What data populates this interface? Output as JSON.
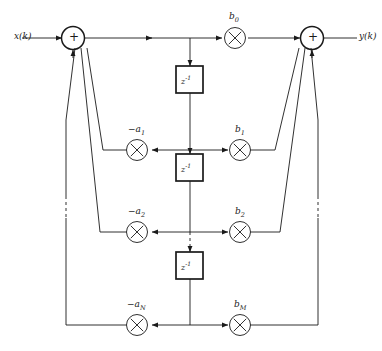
{
  "diagram": {
    "stroke_color": "#1a1a1a",
    "background_color": "#ffffff",
    "input_label": "x(k)",
    "output_label": "y(k)",
    "adder_symbol": "+",
    "multiplier_symbol": "✕",
    "delay_base": "z",
    "delay_exponent": "-1",
    "delay_blocks": [
      {
        "name": "delay-1",
        "label_base": "z",
        "label_exp": "-1"
      },
      {
        "name": "delay-2",
        "label_base": "z",
        "label_exp": "-1"
      },
      {
        "name": "delay-3",
        "label_base": "z",
        "label_exp": "-1"
      }
    ],
    "feedback_coefficients": [
      {
        "base": "−a",
        "sub": "1"
      },
      {
        "base": "−a",
        "sub": "2"
      },
      {
        "base": "−a",
        "sub": "N"
      }
    ],
    "feedforward_coefficients": [
      {
        "base": "b",
        "sub": "0"
      },
      {
        "base": "b",
        "sub": "1"
      },
      {
        "base": "b",
        "sub": "2"
      },
      {
        "base": "b",
        "sub": "M"
      }
    ],
    "adders": [
      {
        "name": "input-adder",
        "symbol": "+"
      },
      {
        "name": "output-adder",
        "symbol": "+"
      }
    ]
  }
}
